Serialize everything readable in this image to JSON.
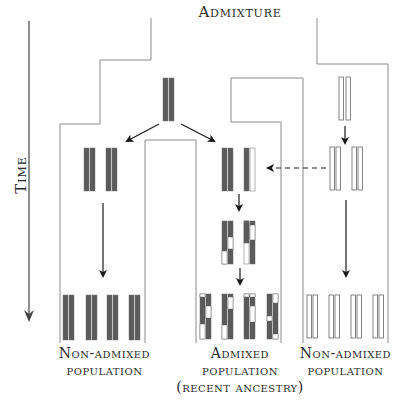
{
  "title": "Admixture",
  "axis": {
    "label": "Time",
    "direction": "down"
  },
  "populations": [
    {
      "id": "left",
      "label_line1": "Non-admixed",
      "label_line2": "population",
      "chromosome_color": "#5a5a5a"
    },
    {
      "id": "middle",
      "label_line1": "Admixed",
      "label_line2": "population",
      "label_line3": "(recent ancestry)",
      "chromosome_color": "mixed"
    },
    {
      "id": "right",
      "label_line1": "Non-admixed",
      "label_line2": "population",
      "chromosome_color": "#ffffff"
    }
  ],
  "colors": {
    "dark_chromosome": "#5a5a5a",
    "light_chromosome": "#ffffff",
    "outline": "#8a8a8a",
    "arrow": "#1a1a1a"
  },
  "footer_ghost_text": "· · · · · · · ·"
}
